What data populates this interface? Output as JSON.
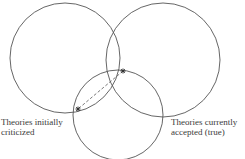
{
  "diagram": {
    "type": "venn",
    "circles": [
      {
        "id": "left",
        "label": [
          "Theories initially",
          "criticized"
        ],
        "cx": 65,
        "cy": 58,
        "r": 55
      },
      {
        "id": "right",
        "label": [
          "Theories currently",
          "accepted (true)"
        ],
        "cx": 163,
        "cy": 60,
        "r": 57
      },
      {
        "id": "bottom",
        "label": [],
        "cx": 118,
        "cy": 115,
        "r": 45
      }
    ],
    "markers": [
      {
        "symbol": "*",
        "x": 123,
        "y": 71
      },
      {
        "symbol": "*",
        "x": 78,
        "y": 109
      }
    ],
    "connector": {
      "style": "dashed",
      "from": 0,
      "to": 1
    },
    "colors": {
      "stroke": "#555555",
      "text": "#3a3a3a",
      "marker": "#333333"
    }
  }
}
